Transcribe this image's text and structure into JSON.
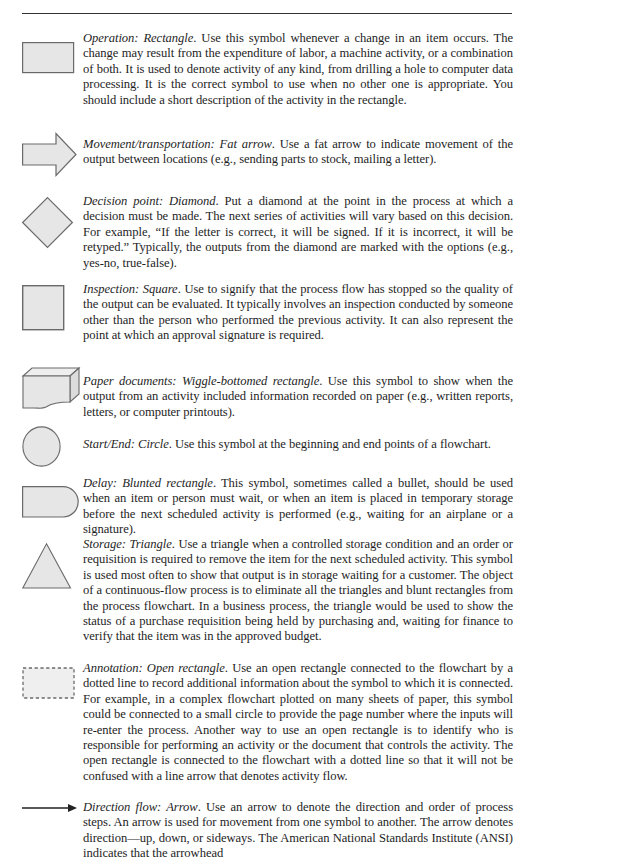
{
  "page": {
    "type": "textbook-page"
  },
  "entries": [
    {
      "symbol": "rectangle",
      "term": "Operation: Rectangle",
      "body": ". Use this symbol whenever a change in an item occurs. The change may result from the expenditure of labor, a machine activity, or a combination of both. It is used to denote activity of any kind, from drilling a hole to computer data processing. It is the correct symbol to use when no other one is appropriate. You should include a short description of the activity in the rectangle."
    },
    {
      "symbol": "fat-arrow",
      "term": "Movement/transportation: Fat arrow",
      "body": ". Use a fat arrow to indicate movement of the output between locations (e.g., sending parts to stock, mailing a letter)."
    },
    {
      "symbol": "diamond",
      "term": "Decision point: Diamond",
      "body": ". Put a diamond at the point in the process at which a decision must be made. The next series of activities will vary based on this decision. For example, “If the letter is correct, it will be signed. If it is incorrect, it will be retyped.” Typically, the outputs from the diamond are marked with the options (e.g., yes-no, true-false)."
    },
    {
      "symbol": "square",
      "term": "Inspection: Square",
      "body": ". Use to signify that the process flow has stopped so the quality of the output can be evaluated. It typically involves an inspection conducted by someone other than the person who performed the previous activity. It can also represent the point at which an approval signature is required."
    },
    {
      "symbol": "wiggle-bottomed-rectangle",
      "term": "Paper documents: Wiggle-bottomed rectangle",
      "body": ". Use this symbol to show when the output from an activity included information recorded on paper (e.g., written reports, letters, or computer printouts)."
    },
    {
      "symbol": "circle",
      "term": "Start/End: Circle",
      "body": ". Use this symbol at the beginning and end points of a flowchart."
    },
    {
      "symbol": "blunted-rectangle",
      "term": "Delay: Blunted rectangle",
      "body": ". This symbol, sometimes called a bullet, should be used when an item or person must wait, or when an item is placed in temporary storage before the next scheduled activity is performed (e.g., waiting for an airplane or a signature)."
    },
    {
      "symbol": "triangle",
      "term": "Storage: Triangle",
      "body": ". Use a triangle when a controlled storage condition and an order or requisition is required to remove the item for the next scheduled activity. This symbol is used most often to show that output is in storage waiting for a customer. The object of a continuous-flow process is to eliminate all the triangles and blunt rectangles from the process flowchart. In a business process, the triangle would be used to show the status of a purchase requisition being held by purchasing and, waiting for finance to verify that the item was in the approved budget."
    },
    {
      "symbol": "open-rectangle",
      "term": "Annotation: Open rectangle",
      "body": ". Use an open rectangle connected to the flowchart by a dotted line to record additional information about the symbol to which it is connected. For example, in a complex flowchart plotted on many sheets of paper, this symbol could be connected to a small circle to provide the page number where the inputs will re-enter the process. Another way to use an open rectangle is to identify who is responsible for performing an activity or the document that controls the activity. The open rectangle is connected to the flowchart with a dotted line so that it will not be confused with a line arrow that denotes activity flow."
    },
    {
      "symbol": "line-arrow",
      "term": "Direction flow: Arrow",
      "body": ". Use an arrow to denote the direction and order of process steps. An arrow is used for movement from one symbol to another. The arrow denotes direction—up, down, or sideways. The American National Standards Institute (ANSI) indicates that the arrowhead"
    }
  ],
  "colors": {
    "symbol_fill": "#e6e6e6",
    "symbol_stroke": "#6a6a6a",
    "text": "#1e1e1e",
    "rule": "#333333"
  }
}
